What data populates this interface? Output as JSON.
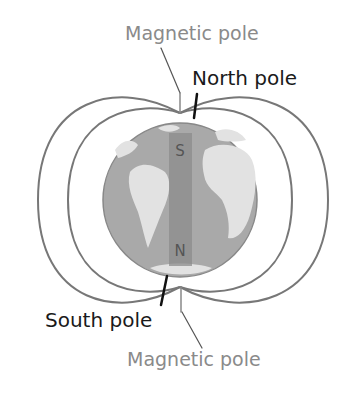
{
  "diagram": {
    "labels": {
      "magnetic_pole_top": "Magnetic pole",
      "north_pole": "North pole",
      "south_pole": "South pole",
      "magnetic_pole_bottom": "Magnetic pole"
    },
    "magnet": {
      "top_letter": "S",
      "bottom_letter": "N"
    },
    "colors": {
      "field_line": "#777777",
      "earth_ocean": "#a9a9a9",
      "earth_land": "#e2e2e2",
      "magnet_bar": "#8c8c8c",
      "gray_label": "#8a8a8a",
      "black_label": "#1a1a1a"
    }
  }
}
